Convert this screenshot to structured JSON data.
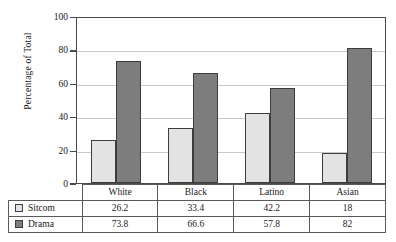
{
  "chart_data": {
    "type": "bar",
    "title": "",
    "xlabel": "",
    "ylabel": "Percentage of Total",
    "ylim": [
      0,
      100
    ],
    "yticks": [
      0,
      20,
      40,
      60,
      80,
      100
    ],
    "grid": true,
    "legend_position": "table-left",
    "categories": [
      "White",
      "Black",
      "Latino",
      "Asian"
    ],
    "series": [
      {
        "name": "Sitcom",
        "color": "#e3e3e3",
        "values": [
          26.2,
          33.4,
          42.2,
          18
        ]
      },
      {
        "name": "Drama",
        "color": "#7d7d7d",
        "values": [
          73.8,
          66.6,
          57.8,
          82
        ]
      }
    ],
    "value_labels": {
      "Sitcom": [
        "26.2",
        "33.4",
        "42.2",
        "18"
      ],
      "Drama": [
        "73.8",
        "66.6",
        "57.8",
        "82"
      ]
    },
    "tick_labels": [
      "0",
      "20",
      "40",
      "60",
      "80",
      "100"
    ]
  },
  "axis": {
    "y_title": "Percentage of Total",
    "ticks": [
      "100",
      "80",
      "60",
      "40",
      "20",
      "0"
    ]
  },
  "table": {
    "category_row": [
      "White",
      "Black",
      "Latino",
      "Asian"
    ],
    "rows": [
      {
        "legend": "Sitcom",
        "swatch": "sitcom-swatch",
        "values": [
          "26.2",
          "33.4",
          "42.2",
          "18"
        ]
      },
      {
        "legend": "Drama",
        "swatch": "drama-swatch",
        "values": [
          "73.8",
          "66.6",
          "57.8",
          "82"
        ]
      }
    ]
  },
  "caption": {
    "text": ""
  },
  "colors": {
    "sitcom": "#e3e3e3",
    "drama": "#7d7d7d",
    "gridline": "#c9c9c9",
    "frame": "#4a4a4a"
  }
}
